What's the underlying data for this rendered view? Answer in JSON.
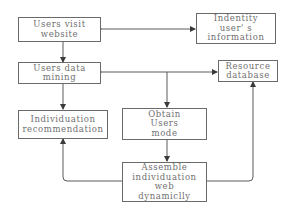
{
  "diagram": {
    "nodes": {
      "visit": {
        "lines": [
          "Users visit",
          "website"
        ]
      },
      "identity": {
        "lines": [
          "Indentity",
          "user' s",
          "information"
        ]
      },
      "mining": {
        "lines": [
          "Users data",
          "mining"
        ]
      },
      "resource": {
        "lines": [
          "Resource",
          "database"
        ]
      },
      "recommend": {
        "lines": [
          "Individuation",
          "recommendation"
        ]
      },
      "obtain": {
        "lines": [
          "Obtain",
          "Users",
          "mode"
        ]
      },
      "assemble": {
        "lines": [
          "Assemble",
          "individuation",
          "web",
          "dynamiclly"
        ]
      }
    },
    "edges": [
      {
        "from": "visit",
        "to": "identity",
        "direction": "both"
      },
      {
        "from": "visit",
        "to": "mining",
        "direction": "forward"
      },
      {
        "from": "mining",
        "to": "resource",
        "direction": "both"
      },
      {
        "from": "mining",
        "to": "recommend",
        "direction": "forward"
      },
      {
        "from": "mining",
        "to": "obtain",
        "direction": "forward"
      },
      {
        "from": "obtain",
        "to": "assemble",
        "direction": "forward"
      },
      {
        "from": "assemble",
        "to": "recommend",
        "direction": "forward"
      },
      {
        "from": "assemble",
        "to": "resource",
        "direction": "forward"
      }
    ],
    "colors": {
      "line": "#5a5a5a",
      "text": "#707070",
      "border": "#6a6a6a"
    }
  }
}
